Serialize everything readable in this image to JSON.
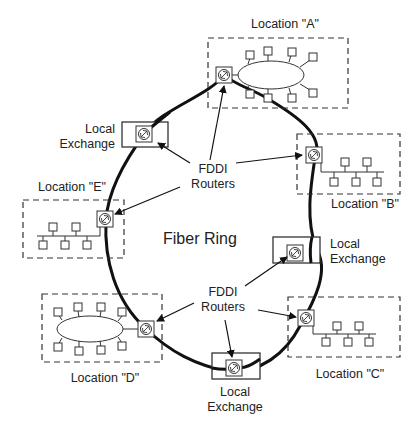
{
  "diagram": {
    "title": "Fiber Ring",
    "locations": [
      {
        "id": "A",
        "label": "Location \"A\"",
        "lan_type": "ring",
        "nodes": 8
      },
      {
        "id": "B",
        "label": "Location \"B\"",
        "lan_type": "bus",
        "nodes": 5
      },
      {
        "id": "C",
        "label": "Location \"C\"",
        "lan_type": "bus",
        "nodes": 5
      },
      {
        "id": "D",
        "label": "Location \"D\"",
        "lan_type": "ring",
        "nodes": 8
      },
      {
        "id": "E",
        "label": "Location \"E\"",
        "lan_type": "bus",
        "nodes": 5
      }
    ],
    "exchanges": [
      {
        "line1": "Local",
        "line2": "Exchange"
      },
      {
        "line1": "Local",
        "line2": "Exchange"
      },
      {
        "line1": "Local",
        "line2": "Exchange"
      }
    ],
    "router_labels": [
      {
        "line1": "FDDI",
        "line2": "Routers"
      },
      {
        "line1": "FDDI",
        "line2": "Routers"
      }
    ],
    "colors": {
      "line": "#111111",
      "box": "#333333",
      "bg": "#ffffff"
    }
  }
}
